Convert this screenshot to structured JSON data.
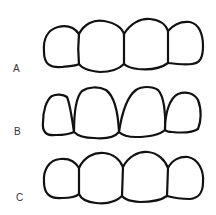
{
  "figure": {
    "rows": [
      {
        "label": "A",
        "description": "four crowns, rounded contours, tight contacts"
      },
      {
        "label": "B",
        "description": "four crowns, tapered/triangular crowns with cervical embrasures"
      },
      {
        "label": "C",
        "description": "four crowns, bulbous rounded contours"
      }
    ],
    "stroke_color": "#111111",
    "label_color": "#333333"
  }
}
